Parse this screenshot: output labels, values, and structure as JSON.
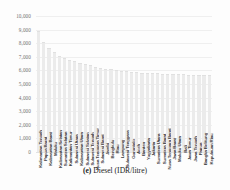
{
  "figure": {
    "caption_tag": "(e)",
    "caption_text": "Diesel (IDR/litre)"
  },
  "axis": {
    "y_ticks": [
      "10,000",
      "9,000",
      "8,000",
      "7,000",
      "6,000",
      "5,000",
      "4,000",
      "3,000",
      "2,000",
      "1,000",
      "0"
    ]
  },
  "colors": {
    "bar_fill": "#ebebeb",
    "gridline": "#efefef",
    "tick_text": "#6f6f6f",
    "label_text": "#3b3b3b",
    "background": "#fdfdfd"
  },
  "chart_data": {
    "type": "bar",
    "title": "",
    "subtitle": "",
    "xlabel": "",
    "ylabel": "",
    "ylim": [
      0,
      10000
    ],
    "ytick_step": 1000,
    "grid": true,
    "legend": false,
    "legend_position": "none",
    "orientation": "vertical",
    "sorted": "descending",
    "value_unit": "IDR/litre",
    "categories": [
      "Kalimantan Tengah",
      "Papua Barat",
      "Kalimantan Barat",
      "Maluku",
      "Kalimantan Selatan",
      "Sumatera Selatan",
      "Kalimantan Timur",
      "Sulawesi Utara",
      "Kalimantan Utara",
      "Sulawesi Selatan",
      "Sulawesi Tengah",
      "Nusa Tenggara Timur",
      "Sulawesi Barat",
      "Jambi",
      "Bengkulu",
      "Riau",
      "Lampung",
      "Sulawesi Tenggara",
      "Gorontalo",
      "Aceh",
      "Banten",
      "Yogyakarta",
      "Jakarta",
      "Sumatera Utara",
      "Sumatera Barat",
      "Nusa Tenggara Barat",
      "Jawa Barat",
      "Maluku Utara",
      "Bali",
      "Jawa Timur",
      "Jawa Tengah",
      "Papua",
      "Bangka Belitung",
      "Kepulauan Riau"
    ],
    "values": [
      8800,
      8050,
      7600,
      7300,
      7000,
      6850,
      6700,
      6600,
      6500,
      6400,
      6300,
      6200,
      6100,
      6050,
      6000,
      5950,
      5900,
      5850,
      5800,
      5780,
      5760,
      5740,
      5720,
      5700,
      5680,
      5660,
      5650,
      5640,
      5630,
      5620,
      5610,
      5600,
      5590,
      5580
    ]
  }
}
